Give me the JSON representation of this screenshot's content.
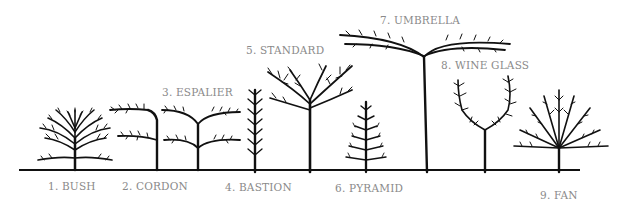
{
  "ground_line": {
    "x1": 19,
    "x2": 580,
    "y": 170,
    "color": "#111111"
  },
  "label_color": "#8a8a8a",
  "forms": [
    {
      "number": 1,
      "label": "1. BUSH",
      "x": 48,
      "y": 187
    },
    {
      "number": 2,
      "label": "2. CORDON",
      "x": 122,
      "y": 187
    },
    {
      "number": 3,
      "label": "3. ESPALIER",
      "x": 162,
      "y": 86
    },
    {
      "number": 4,
      "label": "4. BASTION",
      "x": 225,
      "y": 187
    },
    {
      "number": 5,
      "label": "5. STANDARD",
      "x": 246,
      "y": 45
    },
    {
      "number": 6,
      "label": "6. PYRAMID",
      "x": 335,
      "y": 188
    },
    {
      "number": 7,
      "label": "7. UMBRELLA",
      "x": 380,
      "y": 14
    },
    {
      "number": 8,
      "label": "8. WINE GLASS",
      "x": 441,
      "y": 60
    },
    {
      "number": 9,
      "label": "9. FAN",
      "x": 540,
      "y": 191
    }
  ]
}
